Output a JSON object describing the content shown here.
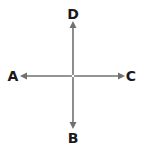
{
  "diagram": {
    "type": "compass-cross",
    "line_color": "#707070",
    "label_color": "#1a1a1a",
    "center": {
      "x": 73,
      "y": 76
    },
    "labels": {
      "top": "D",
      "bottom": "B",
      "left": "A",
      "right": "C"
    },
    "arrows": [
      {
        "direction": "up",
        "to_label": "D"
      },
      {
        "direction": "down",
        "to_label": "B"
      },
      {
        "direction": "left",
        "to_label": "A"
      },
      {
        "direction": "right",
        "to_label": "C"
      }
    ]
  }
}
